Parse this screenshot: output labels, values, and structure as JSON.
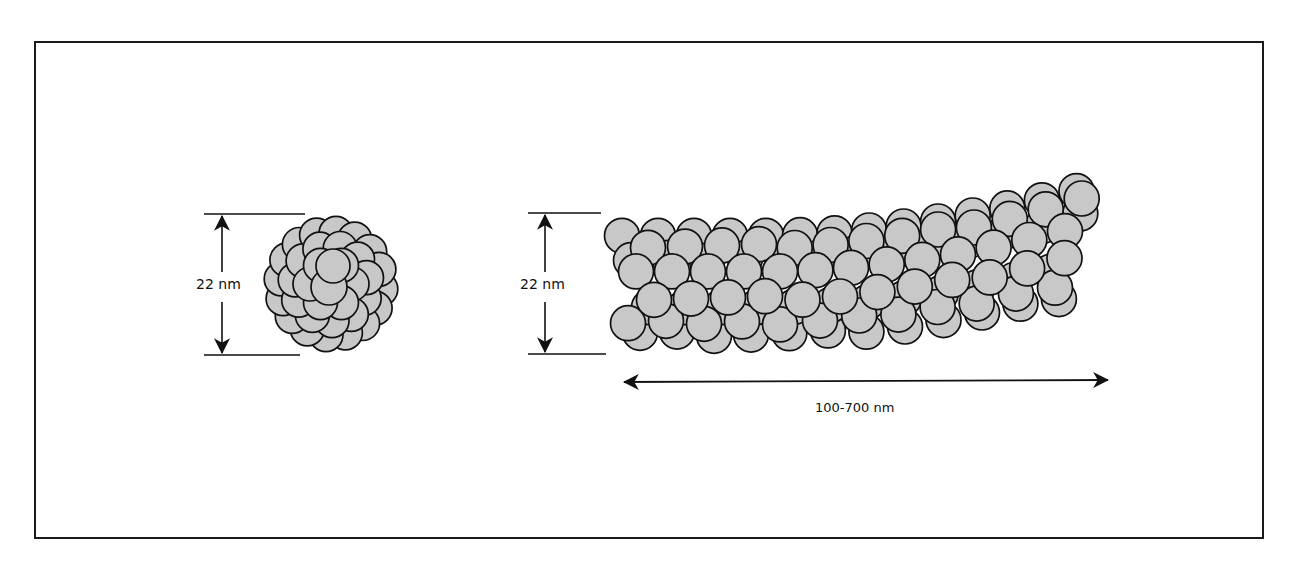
{
  "figure": {
    "left_particle": {
      "name": "spherical-aggregate",
      "dimension_label": "22 nm"
    },
    "right_particle": {
      "name": "rod-aggregate",
      "diameter_label": "22 nm",
      "length_label": "100-700 nm"
    },
    "colors": {
      "sphere_fill": "#c8c8c8",
      "sphere_stroke": "#111111",
      "line": "#111111",
      "background": "#ffffff"
    }
  }
}
